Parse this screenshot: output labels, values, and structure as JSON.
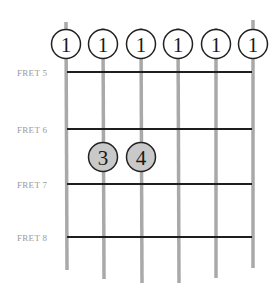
{
  "diagram": {
    "type": "guitar-chord-fretboard",
    "strings": 6,
    "colors": {
      "string": "#a9a9a9",
      "fret": "#1e1e1e",
      "open_fill": "#ffffff",
      "finger_fill": "#c9c9c9",
      "label": "#9a9a9a",
      "outline": "#222222"
    },
    "frets": [
      {
        "label": "FRET 5"
      },
      {
        "label": "FRET 6"
      },
      {
        "label": "FRET 7"
      },
      {
        "label": "FRET 8"
      }
    ],
    "barre_markers": [
      {
        "string": 1,
        "finger": "1"
      },
      {
        "string": 2,
        "finger": "1"
      },
      {
        "string": 3,
        "finger": "1"
      },
      {
        "string": 4,
        "finger": "1"
      },
      {
        "string": 5,
        "finger": "1"
      },
      {
        "string": 6,
        "finger": "1"
      }
    ],
    "finger_markers": [
      {
        "string": 2,
        "fret": "between FRET 6 and FRET 7",
        "finger": "3"
      },
      {
        "string": 3,
        "fret": "between FRET 6 and FRET 7",
        "finger": "4"
      }
    ]
  }
}
